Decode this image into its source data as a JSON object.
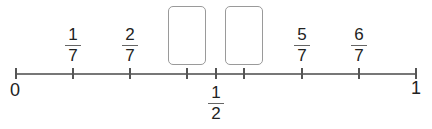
{
  "number_line": {
    "start_label": "0",
    "end_label": "1",
    "denominator": 7,
    "fractions": [
      {
        "num": "1",
        "den": "7"
      },
      {
        "num": "2",
        "den": "7"
      },
      {
        "num": "5",
        "den": "7"
      },
      {
        "num": "6",
        "den": "7"
      }
    ],
    "half": {
      "num": "1",
      "den": "2"
    },
    "answer_boxes": [
      {
        "value": ""
      },
      {
        "value": ""
      }
    ]
  }
}
